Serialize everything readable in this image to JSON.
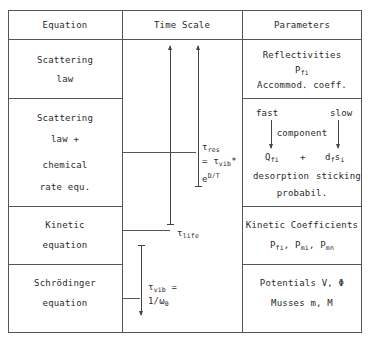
{
  "table": {
    "headers": [
      "Equation",
      "Time Scale",
      "Parameters"
    ],
    "rows": [
      {
        "equation": [
          "Scattering",
          "law"
        ],
        "parameters": [
          "Reflectivities",
          "P",
          "fi",
          "Accommod. coeff."
        ]
      },
      {
        "equation": [
          "Scattering",
          "law +",
          "chemical",
          "rate equ."
        ],
        "parameters": {
          "fast": "fast",
          "slow": "slow",
          "component": "component",
          "q": "Q",
          "q_sub": "fi",
          "plus": "+",
          "d": "d",
          "d_sub": "f",
          "s": "s",
          "s_sub": "i",
          "desorption": "desorption",
          "sticking": "sticking",
          "probabil": "probabil."
        }
      },
      {
        "equation": [
          "Kinetic",
          "equation"
        ],
        "parameters": [
          "Kinetic Coefficients",
          "P",
          "fi",
          ", P",
          "mi",
          ", P",
          "mn"
        ]
      },
      {
        "equation": [
          "Schrödinger",
          "equation"
        ],
        "parameters": [
          "Potentials V, Φ",
          "Musses m, M"
        ]
      }
    ]
  },
  "time_scale": {
    "tau_res": {
      "sym": "τ",
      "sub": "res"
    },
    "eq_line": {
      "prefix": "= τ",
      "sub": "vib",
      "suffix": "*"
    },
    "exp_line": {
      "base": "e",
      "sup": "D/T"
    },
    "tau_life": {
      "sym": "τ",
      "sub": "life"
    },
    "tau_vib": {
      "sym": "τ",
      "sub": "vib",
      "suffix": " ="
    },
    "omega_line": {
      "prefix": "1/ω",
      "sub": "0"
    }
  }
}
